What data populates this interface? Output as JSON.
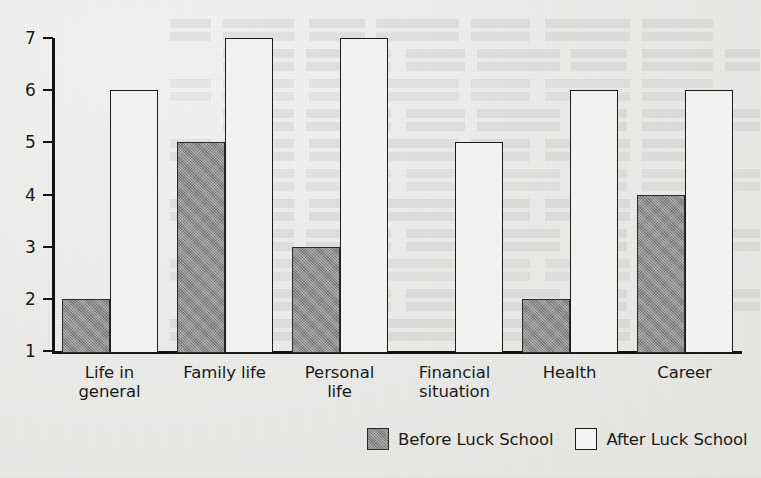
{
  "chart_data": {
    "type": "bar",
    "title": "",
    "subtitle": "",
    "xlabel": "",
    "ylabel": "",
    "grid": false,
    "legend_position": "bottom",
    "ylim": [
      1,
      7
    ],
    "yticks": [
      "1",
      "2",
      "3",
      "4",
      "5",
      "6",
      "7"
    ],
    "categories": [
      "Life in general",
      "Family life",
      "Personal life",
      "Financial situation",
      "Health",
      "Career"
    ],
    "category_lines": [
      [
        "Life in",
        "general"
      ],
      [
        "Family life",
        ""
      ],
      [
        "Personal",
        "life"
      ],
      [
        "Financial",
        "situation"
      ],
      [
        "Health",
        ""
      ],
      [
        "Career",
        ""
      ]
    ],
    "series": [
      {
        "name": "Before Luck School",
        "color": "#8b8b8b",
        "values": [
          2,
          5,
          3,
          1,
          2,
          4
        ]
      },
      {
        "name": "After Luck School",
        "color": "#f2f2f0",
        "values": [
          6,
          7,
          7,
          5,
          6,
          6
        ]
      }
    ]
  },
  "legend": {
    "entries": [
      {
        "label": "Before Luck School",
        "swatch": "filled-gray-swatch"
      },
      {
        "label": "After Luck School",
        "swatch": "outlined-white-swatch"
      }
    ]
  }
}
